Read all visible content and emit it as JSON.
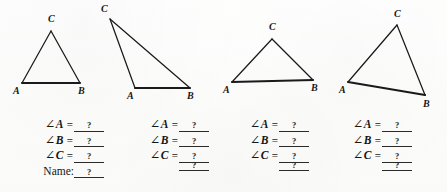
{
  "worksheet": {
    "title": "Triangle Angle Measurement Worksheet",
    "background_color": "#fdfdfc",
    "ink_color": "#1a1a1a",
    "blank_value": "?"
  },
  "figures": [
    {
      "name": "triangle-1",
      "vertices": {
        "A": {
          "x": 22,
          "y": 83,
          "label": "A",
          "label_x": 13,
          "label_y": 86
        },
        "B": {
          "x": 80,
          "y": 83,
          "label": "B",
          "label_x": 78,
          "label_y": 86
        },
        "C": {
          "x": 51,
          "y": 31,
          "label": "C",
          "label_x": 48,
          "label_y": 14
        }
      },
      "base_emphasized": true
    },
    {
      "name": "triangle-2",
      "vertices": {
        "A": {
          "x": 135,
          "y": 88,
          "label": "A",
          "label_x": 127,
          "label_y": 91
        },
        "B": {
          "x": 190,
          "y": 88,
          "label": "B",
          "label_x": 187,
          "label_y": 91
        },
        "C": {
          "x": 110,
          "y": 19,
          "label": "C",
          "label_x": 101,
          "label_y": 4
        }
      },
      "base_emphasized": true
    },
    {
      "name": "triangle-3",
      "vertices": {
        "A": {
          "x": 232,
          "y": 82,
          "label": "A",
          "label_x": 223,
          "label_y": 85
        },
        "B": {
          "x": 313,
          "y": 80,
          "label": "B",
          "label_x": 311,
          "label_y": 83
        },
        "C": {
          "x": 272,
          "y": 39,
          "label": "C",
          "label_x": 269,
          "label_y": 22
        }
      },
      "base_emphasized": true
    },
    {
      "name": "triangle-4",
      "vertices": {
        "A": {
          "x": 348,
          "y": 82,
          "label": "A",
          "label_x": 339,
          "label_y": 85
        },
        "B": {
          "x": 425,
          "y": 95,
          "label": "B",
          "label_x": 423,
          "label_y": 99
        },
        "C": {
          "x": 397,
          "y": 25,
          "label": "C",
          "label_x": 394,
          "label_y": 9
        }
      },
      "base_emphasized": true
    }
  ],
  "columns": [
    {
      "name": "answers-column-1",
      "left": 38,
      "label_width": 36,
      "blank_width": 30,
      "rows": [
        {
          "glyph": "∠",
          "label": "A",
          "eq": "=",
          "value": "?"
        },
        {
          "glyph": "∠",
          "label": "B",
          "eq": "=",
          "value": "?"
        },
        {
          "glyph": "∠",
          "label": "C",
          "eq": "=",
          "value": "?"
        },
        {
          "glyph": "",
          "label": "Name:",
          "eq": "",
          "value": "?",
          "plain": true
        }
      ]
    },
    {
      "name": "answers-column-2",
      "left": 143,
      "label_width": 36,
      "blank_width": 30,
      "rows": [
        {
          "glyph": "∠",
          "label": "A",
          "eq": "=",
          "value": "?"
        },
        {
          "glyph": "∠",
          "label": "B",
          "eq": "=",
          "value": "?"
        },
        {
          "glyph": "∠",
          "label": "C",
          "eq": "=",
          "value": "?"
        },
        {
          "glyph": "",
          "label": "",
          "eq": "",
          "value": "?",
          "plain": true
        }
      ]
    },
    {
      "name": "answers-column-3",
      "left": 243,
      "label_width": 36,
      "blank_width": 30,
      "rows": [
        {
          "glyph": "∠",
          "label": "A",
          "eq": "=",
          "value": "?"
        },
        {
          "glyph": "∠",
          "label": "B",
          "eq": "=",
          "value": "?"
        },
        {
          "glyph": "∠",
          "label": "C",
          "eq": "=",
          "value": "?"
        },
        {
          "glyph": "",
          "label": "",
          "eq": "",
          "value": "?",
          "plain": true
        }
      ]
    },
    {
      "name": "answers-column-4",
      "left": 346,
      "label_width": 36,
      "blank_width": 30,
      "rows": [
        {
          "glyph": "∠",
          "label": "A",
          "eq": "=",
          "value": "?"
        },
        {
          "glyph": "∠",
          "label": "B",
          "eq": "=",
          "value": "?"
        },
        {
          "glyph": "∠",
          "label": "C",
          "eq": "=",
          "value": "?"
        },
        {
          "glyph": "",
          "label": "",
          "eq": "",
          "value": "?",
          "plain": true
        }
      ]
    }
  ]
}
